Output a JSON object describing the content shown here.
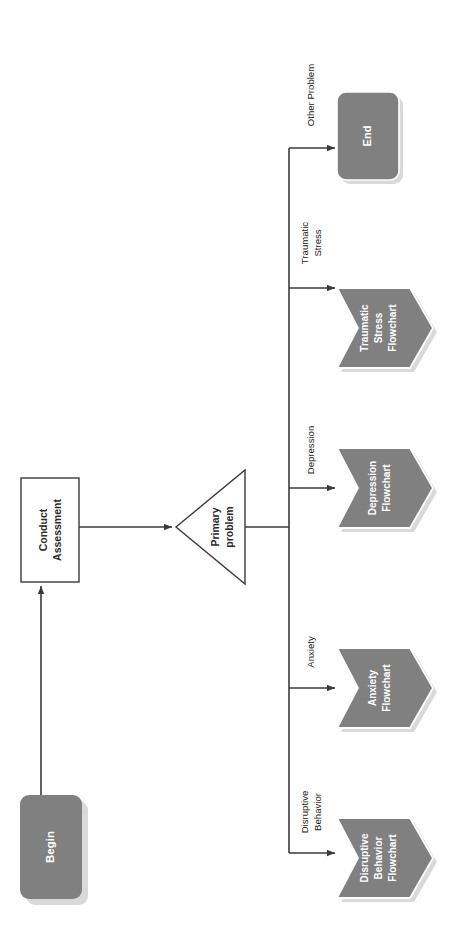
{
  "diagram": {
    "orientation": "rotated-90-clockwise",
    "colors": {
      "node_fill": "#808080",
      "node_text": "#ffffff",
      "process_fill": "#ffffff",
      "process_stroke": "#3a3a3a",
      "process_text": "#2b2b2b",
      "line": "#3a3a3a",
      "shadow": "#d9d9d9",
      "background": "#ffffff"
    },
    "nodes": [
      {
        "id": "begin",
        "label": "Begin",
        "shape": "rounded-rect",
        "style": "filled"
      },
      {
        "id": "assess",
        "label": "Conduct\nAssessment",
        "shape": "rect",
        "style": "outline"
      },
      {
        "id": "decision",
        "label": "Primary\nproblem",
        "shape": "triangle",
        "style": "outline"
      },
      {
        "id": "disruptive",
        "label": "Disruptive\nBehavior\nFlowchart",
        "shape": "pentagon",
        "style": "filled"
      },
      {
        "id": "anxiety",
        "label": "Anxiety\nFlowchart",
        "shape": "pentagon",
        "style": "filled"
      },
      {
        "id": "depression",
        "label": "Depression\nFlowchart",
        "shape": "pentagon",
        "style": "filled"
      },
      {
        "id": "traumatic",
        "label": "Traumatic\nStress\nFlowchart",
        "shape": "pentagon",
        "style": "filled"
      },
      {
        "id": "end",
        "label": "End",
        "shape": "rounded-rect",
        "style": "filled"
      }
    ],
    "node_text": {
      "begin": "Begin",
      "assess_line1": "Conduct",
      "assess_line2": "Assessment",
      "decision_line1": "Primary",
      "decision_line2": "problem",
      "disruptive_line1": "Disruptive",
      "disruptive_line2": "Behavior",
      "disruptive_line3": "Flowchart",
      "anxiety_line1": "Anxiety",
      "anxiety_line2": "Flowchart",
      "depression_line1": "Depression",
      "depression_line2": "Flowchart",
      "traumatic_line1": "Traumatic",
      "traumatic_line2": "Stress",
      "traumatic_line3": "Flowchart",
      "end": "End"
    },
    "edges": [
      {
        "id": "e1",
        "from": "begin",
        "to": "assess",
        "label": ""
      },
      {
        "id": "e2",
        "from": "assess",
        "to": "decision",
        "label": ""
      },
      {
        "id": "e3",
        "from": "decision",
        "to": "disruptive",
        "label": "Disruptive Behavior"
      },
      {
        "id": "e4",
        "from": "decision",
        "to": "anxiety",
        "label": "Anxiety"
      },
      {
        "id": "e5",
        "from": "decision",
        "to": "depression",
        "label": "Depression"
      },
      {
        "id": "e6",
        "from": "decision",
        "to": "traumatic",
        "label": "Traumatic Stress"
      },
      {
        "id": "e7",
        "from": "decision",
        "to": "end",
        "label": "Other Problem"
      }
    ],
    "edge_text": {
      "disruptive_line1": "Disruptive",
      "disruptive_line2": "Behavior",
      "anxiety": "Anxiety",
      "depression": "Depression",
      "traumatic_line1": "Traumatic",
      "traumatic_line2": "Stress",
      "other_line1": "Other Problem"
    }
  }
}
